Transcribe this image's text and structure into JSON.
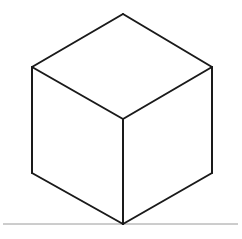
{
  "canvas": {
    "width": 242,
    "height": 239,
    "background_color": "#ffffff",
    "title": "Cube Line Drawing"
  },
  "drawing": {
    "subject": "cube",
    "style": "line-art",
    "stroke_color": "#1a1a1a",
    "stroke_width": 2,
    "fill_color": "#ffffff",
    "ground_line_color": "#9a9a9a",
    "ground_line_width": 1,
    "vertices": {
      "top_apex": {
        "x": 123,
        "y": 14
      },
      "left_upper": {
        "x": 32,
        "y": 67
      },
      "right_upper": {
        "x": 212,
        "y": 67
      },
      "center_front_top": {
        "x": 123,
        "y": 119
      },
      "left_lower": {
        "x": 32,
        "y": 173
      },
      "right_lower": {
        "x": 212,
        "y": 173
      },
      "bottom_apex": {
        "x": 123,
        "y": 224
      }
    },
    "faces": {
      "top": "123,14 212,67 123,119 32,67",
      "left": "32,67 123,119 123,224 32,173",
      "right": "123,119 212,67 212,173 123,224"
    },
    "edges": [
      {
        "name": "top-back-left",
        "d": "M 32,67 L 123,14"
      },
      {
        "name": "top-back-right",
        "d": "M 123,14 L 212,67"
      },
      {
        "name": "top-front-left",
        "d": "M 32,67 L 123,119"
      },
      {
        "name": "top-front-right",
        "d": "M 123,119 L 212,67"
      },
      {
        "name": "vertical-left",
        "d": "M 32,67 L 32,173"
      },
      {
        "name": "vertical-center",
        "d": "M 123,119 L 123,224"
      },
      {
        "name": "vertical-right",
        "d": "M 212,67 L 212,173"
      },
      {
        "name": "bottom-left",
        "d": "M 32,173 L 123,224"
      },
      {
        "name": "bottom-right",
        "d": "M 123,224 L 212,173"
      }
    ],
    "ground_line": {
      "x1": 3,
      "y1": 224,
      "x2": 238,
      "y2": 224
    }
  }
}
